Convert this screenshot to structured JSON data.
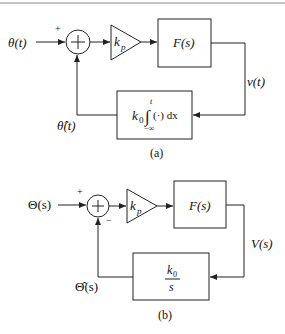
{
  "diagram_a": {
    "caption": "(a)",
    "input_label": "θ(t)",
    "input_sign": "+",
    "gain_label": "k",
    "gain_sub": "p",
    "plant_label": "F(s)",
    "output_label": "v(t)",
    "feedback_gain": "k",
    "feedback_gain_sub": "0",
    "integral_symbol": "∫",
    "integral_upper": "t",
    "integral_lower": "−∞",
    "integrand": "(·) dx",
    "feedback_label": "θ̂(t)"
  },
  "diagram_b": {
    "caption": "(b)",
    "input_label": "Θ(s)",
    "input_sign": "+",
    "feedback_sign": "−",
    "gain_label": "k",
    "gain_sub": "p",
    "plant_label": "F(s)",
    "output_label": "V(s)",
    "feedback_numerator": "k",
    "feedback_numerator_sub": "0",
    "feedback_denominator": "s",
    "feedback_label": "Θ̂(s)"
  }
}
